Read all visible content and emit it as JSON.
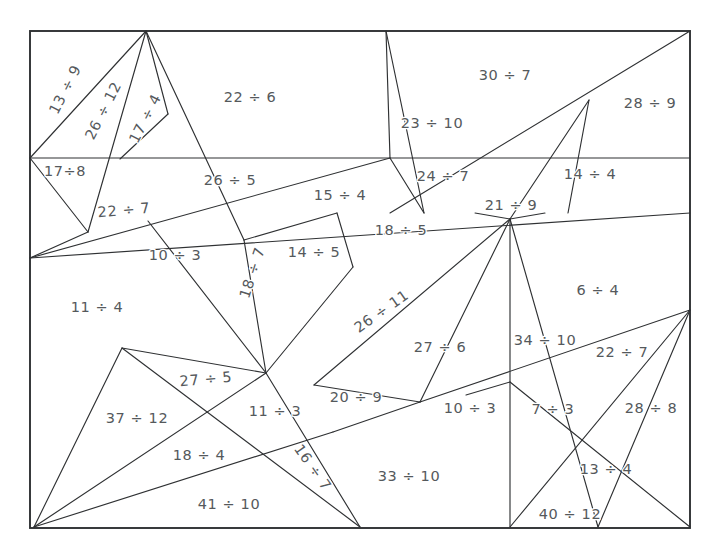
{
  "page": {
    "background_color": "#ffffff",
    "line_color": "#2f3133",
    "text_color": "#55595c"
  },
  "frame": {
    "x": 30,
    "y": 31,
    "width": 660,
    "height": 497
  },
  "chart_data": {
    "type": "diagram",
    "region_count": 36,
    "labels": [
      "13 ÷ 9",
      "26 ÷ 12",
      "17 ÷ 4",
      "17÷8",
      "22 ÷ 6",
      "23 ÷ 10",
      "30 ÷ 7",
      "28 ÷ 9",
      "22 ÷ 7",
      "26 ÷ 5",
      "15 ÷ 4",
      "24 ÷ 7",
      "14 ÷ 4",
      "21 ÷ 9",
      "10 ÷ 3",
      "18 ÷ 7",
      "14 ÷ 5",
      "18 ÷ 5",
      "11 ÷ 4",
      "26 ÷ 11",
      "6 ÷ 4",
      "27 ÷ 6",
      "34 ÷ 10",
      "22 ÷ 7",
      "27 ÷ 5",
      "37 ÷ 12",
      "11 ÷ 3",
      "20 ÷ 9",
      "10 ÷ 3",
      "7 ÷ 3",
      "28 ÷ 8",
      "18 ÷ 4",
      "16 ÷ 7",
      "33 ÷ 10",
      "13 ÷ 4",
      "41 ÷ 10",
      "40 ÷ 12"
    ]
  },
  "regions": [
    {
      "id": "r01",
      "label": "13 ÷ 9",
      "x": 66,
      "y": 90,
      "rotate": -63
    },
    {
      "id": "r02",
      "label": "26 ÷ 12",
      "x": 104,
      "y": 111,
      "rotate": -63
    },
    {
      "id": "r03",
      "label": "17 ÷ 4",
      "x": 146,
      "y": 119,
      "rotate": -63
    },
    {
      "id": "r04",
      "label": "17÷8",
      "x": 65,
      "y": 172,
      "rotate": 0
    },
    {
      "id": "r05",
      "label": "22 ÷ 6",
      "x": 250,
      "y": 98,
      "rotate": 0
    },
    {
      "id": "r06",
      "label": "23 ÷ 10",
      "x": 432,
      "y": 124,
      "rotate": 0
    },
    {
      "id": "r07",
      "label": "30 ÷ 7",
      "x": 505,
      "y": 76,
      "rotate": 0
    },
    {
      "id": "r08",
      "label": "28 ÷ 9",
      "x": 650,
      "y": 104,
      "rotate": 0
    },
    {
      "id": "r09",
      "label": "22 ÷ 7",
      "x": 124,
      "y": 211,
      "rotate": -5
    },
    {
      "id": "r10",
      "label": "26 ÷ 5",
      "x": 230,
      "y": 181,
      "rotate": 0
    },
    {
      "id": "r11",
      "label": "15 ÷ 4",
      "x": 340,
      "y": 196,
      "rotate": 0
    },
    {
      "id": "r12",
      "label": "24 ÷ 7",
      "x": 443,
      "y": 177,
      "rotate": 0
    },
    {
      "id": "r13",
      "label": "14 ÷ 4",
      "x": 590,
      "y": 175,
      "rotate": 0
    },
    {
      "id": "r14",
      "label": "21 ÷ 9",
      "x": 511,
      "y": 206,
      "rotate": 0
    },
    {
      "id": "r15",
      "label": "18 ÷ 5",
      "x": 401,
      "y": 231,
      "rotate": 0
    },
    {
      "id": "r16",
      "label": "10 ÷ 3",
      "x": 175,
      "y": 256,
      "rotate": 0
    },
    {
      "id": "r17",
      "label": "18 ÷ 7",
      "x": 253,
      "y": 273,
      "rotate": -72
    },
    {
      "id": "r18",
      "label": "14 ÷ 5",
      "x": 314,
      "y": 253,
      "rotate": 0
    },
    {
      "id": "r19",
      "label": "11 ÷ 4",
      "x": 97,
      "y": 308,
      "rotate": 0
    },
    {
      "id": "r20",
      "label": "26 ÷ 11",
      "x": 382,
      "y": 312,
      "rotate": -35
    },
    {
      "id": "r21",
      "label": "6 ÷ 4",
      "x": 598,
      "y": 291,
      "rotate": 0
    },
    {
      "id": "r22",
      "label": "27 ÷ 6",
      "x": 440,
      "y": 348,
      "rotate": 0
    },
    {
      "id": "r23",
      "label": "34 ÷ 10",
      "x": 545,
      "y": 341,
      "rotate": 0
    },
    {
      "id": "r24",
      "label": "22 ÷ 7",
      "x": 622,
      "y": 353,
      "rotate": 0
    },
    {
      "id": "r25",
      "label": "27 ÷ 5",
      "x": 206,
      "y": 380,
      "rotate": -5
    },
    {
      "id": "r26",
      "label": "37 ÷ 12",
      "x": 137,
      "y": 419,
      "rotate": 0
    },
    {
      "id": "r27",
      "label": "11 ÷ 3",
      "x": 275,
      "y": 412,
      "rotate": 0
    },
    {
      "id": "r28",
      "label": "20 ÷ 9",
      "x": 356,
      "y": 398,
      "rotate": 0
    },
    {
      "id": "r29",
      "label": "10 ÷ 3",
      "x": 470,
      "y": 409,
      "rotate": 0
    },
    {
      "id": "r30",
      "label": "7 ÷ 3",
      "x": 553,
      "y": 410,
      "rotate": 0
    },
    {
      "id": "r31",
      "label": "28 ÷ 8",
      "x": 651,
      "y": 409,
      "rotate": 0
    },
    {
      "id": "r32",
      "label": "18 ÷ 4",
      "x": 199,
      "y": 456,
      "rotate": 0
    },
    {
      "id": "r33",
      "label": "16 ÷ 7",
      "x": 312,
      "y": 468,
      "rotate": 55
    },
    {
      "id": "r34",
      "label": "33 ÷ 10",
      "x": 409,
      "y": 477,
      "rotate": 0
    },
    {
      "id": "r35",
      "label": "13 ÷ 4",
      "x": 606,
      "y": 470,
      "rotate": 0
    },
    {
      "id": "r36",
      "label": "41 ÷ 10",
      "x": 229,
      "y": 505,
      "rotate": 0
    },
    {
      "id": "r37",
      "label": "40 ÷ 12",
      "x": 570,
      "y": 515,
      "rotate": 0
    }
  ],
  "lines": [
    {
      "id": "l01",
      "x1": 30,
      "y1": 158,
      "x2": 690,
      "y2": 158
    },
    {
      "id": "l02",
      "x1": 30,
      "y1": 158,
      "x2": 146,
      "y2": 31
    },
    {
      "id": "l03",
      "x1": 146,
      "y1": 31,
      "x2": 88,
      "y2": 232
    },
    {
      "id": "l04",
      "x1": 146,
      "y1": 31,
      "x2": 168,
      "y2": 114
    },
    {
      "id": "l05",
      "x1": 168,
      "y1": 114,
      "x2": 120,
      "y2": 159
    },
    {
      "id": "l06",
      "x1": 30,
      "y1": 158,
      "x2": 88,
      "y2": 232
    },
    {
      "id": "l07",
      "x1": 146,
      "y1": 31,
      "x2": 244,
      "y2": 240
    },
    {
      "id": "l08",
      "x1": 30,
      "y1": 258,
      "x2": 390,
      "y2": 158
    },
    {
      "id": "l09",
      "x1": 30,
      "y1": 258,
      "x2": 88,
      "y2": 232
    },
    {
      "id": "l10",
      "x1": 390,
      "y1": 158,
      "x2": 386,
      "y2": 31
    },
    {
      "id": "l11",
      "x1": 390,
      "y1": 158,
      "x2": 424,
      "y2": 213
    },
    {
      "id": "l12",
      "x1": 386,
      "y1": 31,
      "x2": 424,
      "y2": 213
    },
    {
      "id": "l13",
      "x1": 30,
      "y1": 258,
      "x2": 690,
      "y2": 213
    },
    {
      "id": "l14",
      "x1": 690,
      "y1": 31,
      "x2": 390,
      "y2": 213
    },
    {
      "id": "l15",
      "x1": 589,
      "y1": 100,
      "x2": 568,
      "y2": 213
    },
    {
      "id": "l16",
      "x1": 589,
      "y1": 100,
      "x2": 510,
      "y2": 219
    },
    {
      "id": "l17",
      "x1": 510,
      "y1": 219,
      "x2": 475,
      "y2": 213
    },
    {
      "id": "l18",
      "x1": 510,
      "y1": 219,
      "x2": 545,
      "y2": 213
    },
    {
      "id": "l19",
      "x1": 244,
      "y1": 240,
      "x2": 266,
      "y2": 373
    },
    {
      "id": "l20",
      "x1": 244,
      "y1": 240,
      "x2": 337,
      "y2": 213
    },
    {
      "id": "l21",
      "x1": 337,
      "y1": 213,
      "x2": 353,
      "y2": 267
    },
    {
      "id": "l22",
      "x1": 353,
      "y1": 267,
      "x2": 266,
      "y2": 373
    },
    {
      "id": "l23",
      "x1": 266,
      "y1": 373,
      "x2": 148,
      "y2": 221
    },
    {
      "id": "l24",
      "x1": 266,
      "y1": 373,
      "x2": 122,
      "y2": 348
    },
    {
      "id": "l25",
      "x1": 122,
      "y1": 348,
      "x2": 34,
      "y2": 527
    },
    {
      "id": "l26",
      "x1": 122,
      "y1": 348,
      "x2": 360,
      "y2": 527
    },
    {
      "id": "l27",
      "x1": 266,
      "y1": 373,
      "x2": 34,
      "y2": 527
    },
    {
      "id": "l28",
      "x1": 266,
      "y1": 373,
      "x2": 360,
      "y2": 527
    },
    {
      "id": "l29",
      "x1": 34,
      "y1": 527,
      "x2": 333,
      "y2": 432
    },
    {
      "id": "l30",
      "x1": 333,
      "y1": 432,
      "x2": 420,
      "y2": 402
    },
    {
      "id": "l31",
      "x1": 510,
      "y1": 219,
      "x2": 314,
      "y2": 385
    },
    {
      "id": "l32",
      "x1": 314,
      "y1": 385,
      "x2": 420,
      "y2": 402
    },
    {
      "id": "l33",
      "x1": 420,
      "y1": 402,
      "x2": 510,
      "y2": 219
    },
    {
      "id": "l34",
      "x1": 510,
      "y1": 219,
      "x2": 510,
      "y2": 527
    },
    {
      "id": "l35",
      "x1": 420,
      "y1": 402,
      "x2": 690,
      "y2": 310
    },
    {
      "id": "l36",
      "x1": 690,
      "y1": 310,
      "x2": 510,
      "y2": 527
    },
    {
      "id": "l37",
      "x1": 690,
      "y1": 310,
      "x2": 598,
      "y2": 527
    },
    {
      "id": "l38",
      "x1": 598,
      "y1": 527,
      "x2": 510,
      "y2": 219
    },
    {
      "id": "l39",
      "x1": 690,
      "y1": 527,
      "x2": 510,
      "y2": 382
    },
    {
      "id": "l40",
      "x1": 510,
      "y1": 382,
      "x2": 466,
      "y2": 395
    }
  ]
}
